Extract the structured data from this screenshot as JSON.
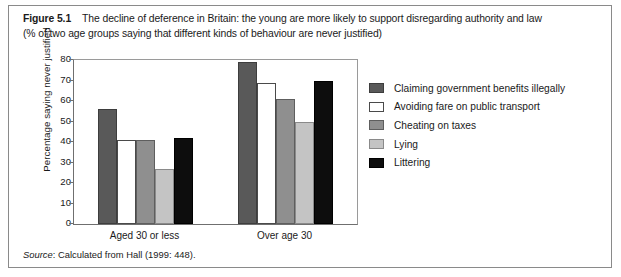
{
  "caption": {
    "figure_number": "Figure 5.1",
    "line1": "The decline of deference in Britain: the young are more likely to support disregarding authority and law",
    "line2": "(% of two age groups saying that different kinds of behaviour are never justified)"
  },
  "source": {
    "label": "Source",
    "text": ": Calculated from Hall (1999: 448)."
  },
  "chart_data": {
    "type": "bar",
    "title": "The decline of deference in Britain: the young are more likely to support disregarding authority and law",
    "subtitle": "(% of two age groups saying that different kinds of behaviour are never justified)",
    "xlabel": "",
    "ylabel": "Percentage saying never justified",
    "ylim": [
      0,
      80
    ],
    "ytick_values": [
      0,
      10,
      20,
      30,
      40,
      50,
      60,
      70,
      80
    ],
    "ytick_labels": [
      "0",
      "10",
      "20",
      "30",
      "40",
      "50",
      "60",
      "70",
      "80"
    ],
    "grid": false,
    "legend_position": "right",
    "categories": [
      "Aged 30 or less",
      "Over age 30"
    ],
    "series": [
      {
        "name": "Claiming government benefits illegally",
        "color": "#595959",
        "border": "#3d3d3d",
        "values": [
          56,
          79
        ]
      },
      {
        "name": "Avoiding fare on public transport",
        "color": "#ffffff",
        "border": "#4a4a4a",
        "values": [
          41,
          69
        ]
      },
      {
        "name": "Cheating on taxes",
        "color": "#8f8f8f",
        "border": "#5e5e5e",
        "values": [
          41,
          61
        ]
      },
      {
        "name": "Lying",
        "color": "#c4c4c4",
        "border": "#8a8a8a",
        "values": [
          27,
          50
        ]
      },
      {
        "name": "Littering",
        "color": "#0d0d0d",
        "border": "#000000",
        "values": [
          42,
          70
        ]
      }
    ]
  }
}
